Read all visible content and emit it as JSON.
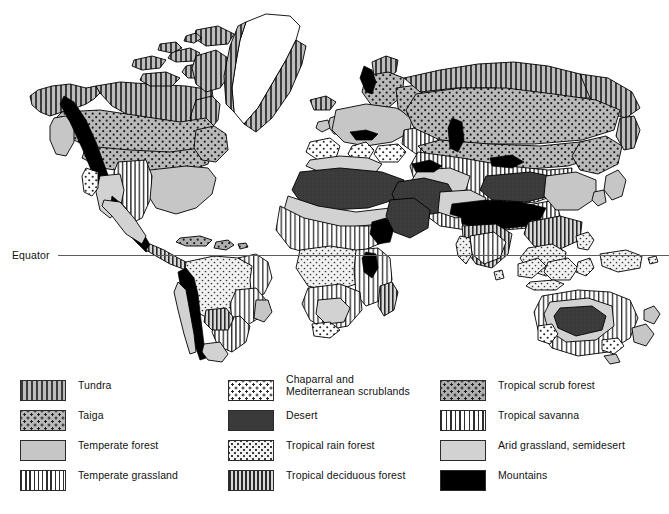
{
  "figure": {
    "equator_label": "Equator"
  },
  "legend": {
    "columns": [
      {
        "items": [
          {
            "label": "Tundra",
            "pattern": "p-tundra",
            "color": "#9a9a9a"
          },
          {
            "label": "Taiga",
            "pattern": "p-taiga",
            "color": "#b9b9b9"
          },
          {
            "label": "Temperate forest",
            "pattern": "p-temp-forest",
            "color": "#c6c6c6"
          },
          {
            "label": "Temperate grassland",
            "pattern": "p-temp-grass",
            "color": "#ffffff"
          }
        ]
      },
      {
        "items": [
          {
            "label": "Chaparral and\nMediterranean scrublands",
            "pattern": "p-chaparral",
            "color": "#ffffff"
          },
          {
            "label": "Desert",
            "pattern": "p-desert",
            "color": "#3a3a3a"
          },
          {
            "label": "Tropical rain forest",
            "pattern": "p-rainforest",
            "color": "#f2f2f2"
          },
          {
            "label": "Tropical deciduous forest",
            "pattern": "p-tropdecid",
            "color": "#a7a7a7"
          }
        ]
      },
      {
        "items": [
          {
            "label": "Tropical scrub forest",
            "pattern": "p-tropscrub",
            "color": "#b0b0b0"
          },
          {
            "label": "Tropical savanna",
            "pattern": "p-savanna",
            "color": "#ffffff"
          },
          {
            "label": "Arid grassland, semidesert",
            "pattern": "p-arid",
            "color": "#d2d2d2"
          },
          {
            "label": "Mountains",
            "pattern": "p-mountains",
            "color": "#000000"
          }
        ]
      }
    ]
  },
  "map": {
    "title": "World biome distribution map",
    "outline_color": "#000000",
    "background_color": "#ffffff"
  }
}
